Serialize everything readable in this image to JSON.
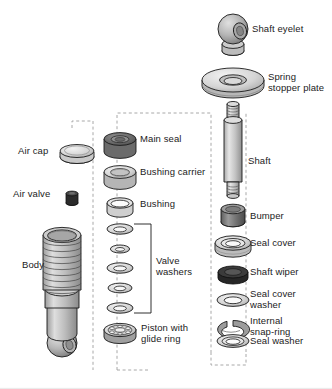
{
  "figure": {
    "type": "exploded-assembly-diagram",
    "background": "#ffffff",
    "line_color": "#1a1a1a",
    "dash_color": "#9a9a9a"
  },
  "palette": {
    "light_gray": "#d8d8d8",
    "mid_gray": "#b4b4b4",
    "dark_gray": "#6e6e6e",
    "very_dark": "#3a3a3a",
    "near_black": "#2a2a2a",
    "highlight": "#efefef",
    "outline": "#1a1a1a"
  },
  "columns": {
    "left": {
      "name": "air-and-body-column",
      "parts": [
        {
          "id": "air-cap",
          "label": "Air cap",
          "shape": "disc-cap",
          "fill": "#e2e2e2"
        },
        {
          "id": "air-valve",
          "label": "Air valve",
          "shape": "small-stud",
          "fill": "#2a2a2a"
        },
        {
          "id": "body",
          "label": "Body",
          "shape": "threaded-body-with-eyelet",
          "fill": "#c9c9c9"
        }
      ]
    },
    "middle": {
      "name": "seal-and-piston-column",
      "parts": [
        {
          "id": "main-seal",
          "label": "Main seal",
          "shape": "thick-ring",
          "fill": "#7a7a7a"
        },
        {
          "id": "bushing-carrier",
          "label": "Bushing carrier",
          "shape": "thick-ring",
          "fill": "#bdbdbd"
        },
        {
          "id": "bushing",
          "label": "Bushing",
          "shape": "open-collar",
          "fill": "#d6d6d6"
        },
        {
          "id": "valve-washers",
          "label": "Valve washers",
          "shape": "washer-stack",
          "fill": "#dcdcdc",
          "count": 5
        },
        {
          "id": "piston-glide-ring",
          "label": "Piston with\nglide ring",
          "shape": "ported-piston",
          "fill": "#c2c2c2"
        }
      ]
    },
    "right": {
      "name": "shaft-column",
      "parts": [
        {
          "id": "shaft-eyelet",
          "label": "Shaft eyelet",
          "shape": "ball-eyelet",
          "fill": "#b9b9b9"
        },
        {
          "id": "spring-stopper-plate",
          "label": "Spring\nstopper plate",
          "shape": "wide-plate",
          "fill": "#d2d2d2"
        },
        {
          "id": "shaft",
          "label": "Shaft",
          "shape": "threaded-rod",
          "fill": "#c6c6c6"
        },
        {
          "id": "bumper",
          "label": "Bumper",
          "shape": "solid-cylinder",
          "fill": "#8a8a8a"
        },
        {
          "id": "seal-cover",
          "label": "Seal cover",
          "shape": "stepped-ring",
          "fill": "#dadada"
        },
        {
          "id": "shaft-wiper",
          "label": "Shaft wiper",
          "shape": "dark-ring",
          "fill": "#3c3c3c"
        },
        {
          "id": "seal-cover-washer",
          "label": "Seal cover\nwasher",
          "shape": "flat-washer",
          "fill": "#d4d4d4"
        },
        {
          "id": "internal-snap-ring",
          "label": "Internal\nsnap-ring",
          "shape": "c-clip",
          "fill": "#9b9b9b"
        },
        {
          "id": "seal-washer",
          "label": "Seal washer",
          "shape": "flat-washer",
          "fill": "#dcdcdc"
        }
      ]
    }
  },
  "labels": {
    "air_cap": "Air cap",
    "air_valve": "Air valve",
    "body": "Body",
    "main_seal": "Main seal",
    "bushing_carrier": "Bushing carrier",
    "bushing": "Bushing",
    "valve_washers_l1": "Valve",
    "valve_washers_l2": "washers",
    "piston_l1": "Piston with",
    "piston_l2": "glide ring",
    "shaft_eyelet": "Shaft eyelet",
    "spring_stopper_l1": "Spring",
    "spring_stopper_l2": "stopper plate",
    "shaft": "Shaft",
    "bumper": "Bumper",
    "seal_cover": "Seal cover",
    "shaft_wiper": "Shaft wiper",
    "seal_cover_washer_l1": "Seal cover",
    "seal_cover_washer_l2": "washer",
    "snap_ring_l1": "Internal",
    "snap_ring_l2": "snap-ring",
    "seal_washer": "Seal washer"
  }
}
